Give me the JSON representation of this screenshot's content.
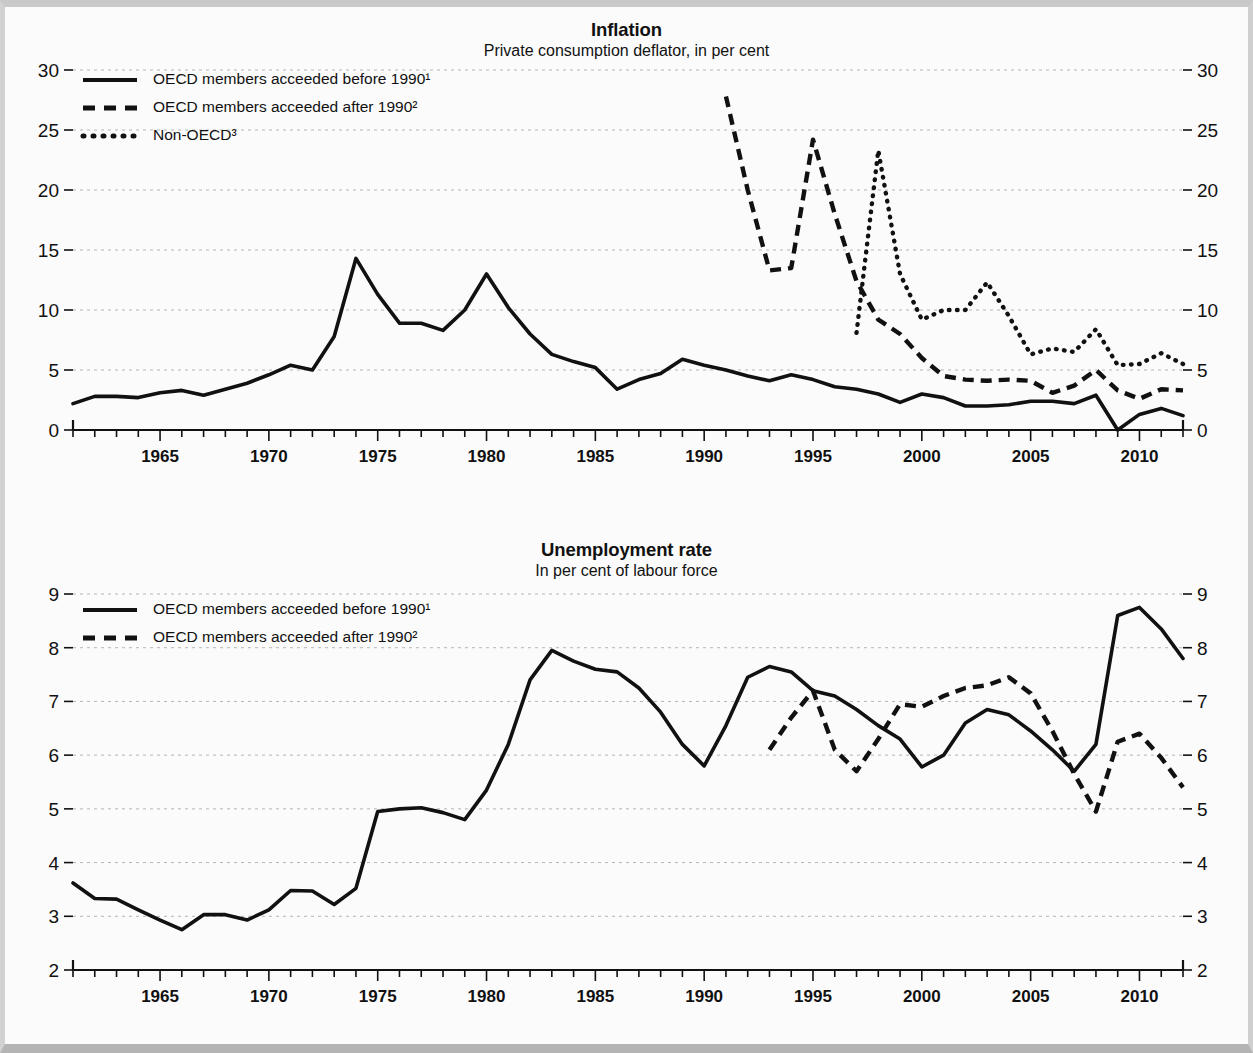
{
  "page": {
    "background_color": "#fbfbfb",
    "frame_color": "#b9b9b9",
    "ink_color": "#111111",
    "grid_color": "#b5b5b5"
  },
  "charts": [
    {
      "id": "inflation",
      "title": "Inflation",
      "subtitle": "Private consumption deflator, in per cent",
      "legend": [
        {
          "label": "OECD members acceeded before 1990¹",
          "style": "solid"
        },
        {
          "label": "OECD members acceeded after 1990²",
          "style": "dashed"
        },
        {
          "label": "Non-OECD³",
          "style": "dotted"
        }
      ]
    },
    {
      "id": "unemployment",
      "title": "Unemployment rate",
      "subtitle": "In per cent of labour force",
      "legend": [
        {
          "label": "OECD members acceeded before 1990¹",
          "style": "solid"
        },
        {
          "label": "OECD members acceeded after 1990²",
          "style": "dashed"
        }
      ]
    }
  ],
  "chart_data": [
    {
      "type": "line",
      "id": "inflation",
      "title": "Inflation",
      "subtitle": "Private consumption deflator, in per cent",
      "xlabel": "",
      "ylabel": "per cent",
      "xlim": [
        1961,
        2012
      ],
      "ylim": [
        0,
        30
      ],
      "yticks": [
        0,
        5,
        10,
        15,
        20,
        25,
        30
      ],
      "ytick_labels": [
        "0",
        "5",
        "10",
        "15",
        "20",
        "25",
        "30"
      ],
      "xticks": [
        1965,
        1970,
        1975,
        1980,
        1985,
        1990,
        1995,
        2000,
        2005,
        2010
      ],
      "xtick_labels": [
        "1965",
        "1970",
        "1975",
        "1980",
        "1985",
        "1990",
        "1995",
        "2000",
        "2005",
        "2010"
      ],
      "minor_xtick_interval": 1,
      "grid": true,
      "grid_axis": "y",
      "legend_position": "top-left",
      "y_axis_mirrored": true,
      "series": [
        {
          "name": "OECD members acceeded before 1990¹",
          "style": "solid",
          "x": [
            1961,
            1962,
            1963,
            1964,
            1965,
            1966,
            1967,
            1968,
            1969,
            1970,
            1971,
            1972,
            1973,
            1974,
            1975,
            1976,
            1977,
            1978,
            1979,
            1980,
            1981,
            1982,
            1983,
            1984,
            1985,
            1986,
            1987,
            1988,
            1989,
            1990,
            1991,
            1992,
            1993,
            1994,
            1995,
            1996,
            1997,
            1998,
            1999,
            2000,
            2001,
            2002,
            2003,
            2004,
            2005,
            2006,
            2007,
            2008,
            2009,
            2010,
            2011,
            2012
          ],
          "values": [
            2.2,
            2.8,
            2.8,
            2.7,
            3.1,
            3.3,
            2.9,
            3.4,
            3.9,
            4.6,
            5.4,
            5.0,
            7.8,
            14.3,
            11.3,
            8.9,
            8.9,
            8.3,
            10.0,
            13.0,
            10.2,
            8.0,
            6.3,
            5.7,
            5.2,
            3.4,
            4.2,
            4.7,
            5.9,
            5.4,
            5.0,
            4.5,
            4.1,
            4.6,
            4.2,
            3.6,
            3.4,
            3.0,
            2.3,
            3.0,
            2.7,
            2.0,
            2.0,
            2.1,
            2.4,
            2.4,
            2.2,
            2.9,
            0.0,
            1.3,
            1.8,
            1.2
          ]
        },
        {
          "name": "OECD members acceeded after 1990²",
          "style": "dashed",
          "x": [
            1991,
            1992,
            1993,
            1994,
            1995,
            1996,
            1997,
            1998,
            1999,
            2000,
            2001,
            2002,
            2003,
            2004,
            2005,
            2006,
            2007,
            2008,
            2009,
            2010,
            2011,
            2012
          ],
          "values": [
            27.8,
            20.0,
            13.3,
            13.5,
            24.2,
            18.0,
            12.4,
            9.2,
            8.0,
            6.0,
            4.5,
            4.2,
            4.1,
            4.2,
            4.1,
            3.1,
            3.7,
            5.0,
            3.3,
            2.6,
            3.4,
            3.3
          ]
        },
        {
          "name": "Non-OECD³",
          "style": "dotted",
          "x": [
            1997,
            1998,
            1999,
            2000,
            2001,
            2002,
            2003,
            2004,
            2005,
            2006,
            2007,
            2008,
            2009,
            2010,
            2011,
            2012
          ],
          "values": [
            8.1,
            23.3,
            13.0,
            9.2,
            10.0,
            10.0,
            12.3,
            9.5,
            6.3,
            6.8,
            6.5,
            8.4,
            5.4,
            5.5,
            6.4,
            5.5
          ]
        }
      ]
    },
    {
      "type": "line",
      "id": "unemployment",
      "title": "Unemployment rate",
      "subtitle": "In per cent of labour force",
      "xlabel": "",
      "ylabel": "per cent of labour force",
      "xlim": [
        1961,
        2012
      ],
      "ylim": [
        2,
        9
      ],
      "yticks": [
        2,
        3,
        4,
        5,
        6,
        7,
        8,
        9
      ],
      "ytick_labels": [
        "2",
        "3",
        "4",
        "5",
        "6",
        "7",
        "8",
        "9"
      ],
      "xticks": [
        1965,
        1970,
        1975,
        1980,
        1985,
        1990,
        1995,
        2000,
        2005,
        2010
      ],
      "xtick_labels": [
        "1965",
        "1970",
        "1975",
        "1980",
        "1985",
        "1990",
        "1995",
        "2000",
        "2005",
        "2010"
      ],
      "minor_xtick_interval": 1,
      "grid": true,
      "grid_axis": "y",
      "legend_position": "top-left",
      "y_axis_mirrored": true,
      "series": [
        {
          "name": "OECD members acceeded before 1990¹",
          "style": "solid",
          "x": [
            1961,
            1962,
            1963,
            1964,
            1965,
            1966,
            1967,
            1968,
            1969,
            1970,
            1971,
            1972,
            1973,
            1974,
            1975,
            1976,
            1977,
            1978,
            1979,
            1980,
            1981,
            1982,
            1983,
            1984,
            1985,
            1986,
            1987,
            1988,
            1989,
            1990,
            1991,
            1992,
            1993,
            1994,
            1995,
            1996,
            1997,
            1998,
            1999,
            2000,
            2001,
            2002,
            2003,
            2004,
            2005,
            2006,
            2007,
            2008,
            2009,
            2010,
            2011,
            2012
          ],
          "values": [
            3.62,
            3.33,
            3.32,
            3.12,
            2.93,
            2.75,
            3.03,
            3.03,
            2.93,
            3.12,
            3.48,
            3.47,
            3.22,
            3.52,
            4.95,
            5.0,
            5.02,
            4.93,
            4.8,
            5.35,
            6.2,
            7.4,
            7.95,
            7.75,
            7.6,
            7.55,
            7.25,
            6.8,
            6.2,
            5.8,
            6.55,
            7.45,
            7.65,
            7.55,
            7.2,
            7.1,
            6.85,
            6.55,
            6.3,
            5.78,
            6.0,
            6.6,
            6.85,
            6.75,
            6.45,
            6.1,
            5.7,
            6.2,
            8.6,
            8.75,
            8.35,
            7.8
          ]
        },
        {
          "name": "OECD members acceeded after 1990²",
          "style": "dashed",
          "x": [
            1993,
            1994,
            1995,
            1996,
            1997,
            1998,
            1999,
            2000,
            2001,
            2002,
            2003,
            2004,
            2005,
            2006,
            2007,
            2008,
            2009,
            2010,
            2011,
            2012
          ],
          "values": [
            6.1,
            6.7,
            7.2,
            6.1,
            5.7,
            6.3,
            6.95,
            6.9,
            7.1,
            7.25,
            7.3,
            7.45,
            7.15,
            6.45,
            5.65,
            4.95,
            6.25,
            6.4,
            5.95,
            5.4
          ]
        }
      ]
    }
  ]
}
